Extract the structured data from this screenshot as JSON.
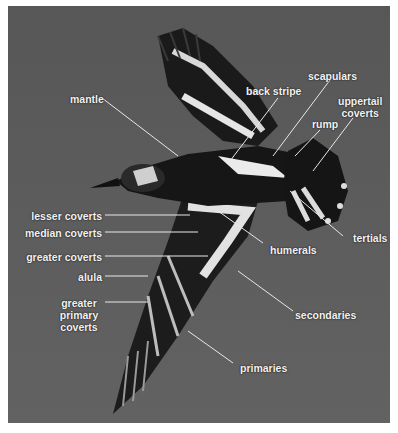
{
  "figure": {
    "colors": {
      "background": "#5b5b5b",
      "label_text": "#f2f2f2",
      "leader_line": "#e8e8e8",
      "border": "#ffffff"
    }
  },
  "labels": {
    "mantle": "mantle",
    "back_stripe": "back stripe",
    "scapulars": "scapulars",
    "rump": "rump",
    "uppertail_coverts_1": "uppertail",
    "uppertail_coverts_2": "coverts",
    "lesser_coverts": "lesser coverts",
    "median_coverts": "median coverts",
    "greater_coverts": "greater coverts",
    "humerals": "humerals",
    "tertials": "tertials",
    "alula": "alula",
    "greater_primary_coverts_1": "greater",
    "greater_primary_coverts_2": "primary",
    "greater_primary_coverts_3": "coverts",
    "secondaries": "secondaries",
    "primaries": "primaries"
  }
}
